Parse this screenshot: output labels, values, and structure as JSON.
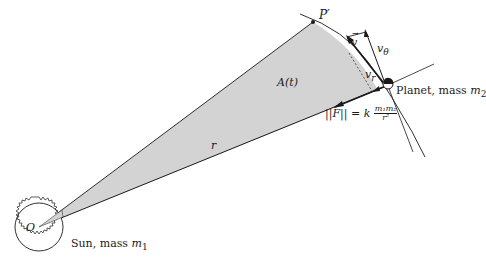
{
  "figure": {
    "type": "kepler-second-law-diagram",
    "colors": {
      "shaded_region": "#d3d3d3",
      "lines": "#1a1a1a",
      "background": "#ffffff"
    }
  },
  "labels": {
    "p_prime": "P′",
    "area": "A(t)",
    "velocity": "v",
    "v_theta": "v",
    "v_theta_sub": "θ",
    "v_r": "v",
    "v_r_sub": "r",
    "radius": "r",
    "origin": "O",
    "planet": "Planet, mass ",
    "planet_mass": "m",
    "planet_mass_sub": "2",
    "sun": "Sun, mass ",
    "sun_mass": "m",
    "sun_mass_sub": "1",
    "force_lhs": "||F|| = k",
    "force_num": "m₁m₂",
    "force_den": "r²"
  }
}
